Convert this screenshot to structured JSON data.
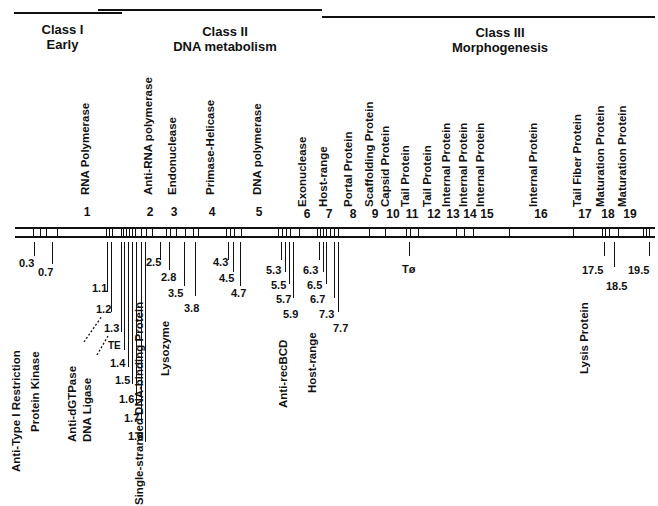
{
  "diagram": {
    "classes": [
      {
        "name": "Class I",
        "subtitle": "Early"
      },
      {
        "name": "Class II",
        "subtitle": "DNA metabolism"
      },
      {
        "name": "Class III",
        "subtitle": "Morphogenesis"
      }
    ],
    "major_genes": [
      {
        "number": "1",
        "label": "RNA Polymerase"
      },
      {
        "number": "2",
        "label": "Anti-RNA polymerase"
      },
      {
        "number": "3",
        "label": "Endonuclease"
      },
      {
        "number": "4",
        "label": "Primase-Helicase"
      },
      {
        "number": "5",
        "label": "DNA polymerase"
      },
      {
        "number": "6",
        "label": "Exonuclease"
      },
      {
        "number": "7",
        "label": "Host-range"
      },
      {
        "number": "8",
        "label": "Portal Protein"
      },
      {
        "number": "9",
        "label": "Scaffolding Protein"
      },
      {
        "number": "10",
        "label": "Capsid Protein"
      },
      {
        "number": "11",
        "label": "Tail Protein"
      },
      {
        "number": "12",
        "label": "Tail Protein"
      },
      {
        "number": "13",
        "label": "Internal Protein"
      },
      {
        "number": "14",
        "label": "Internal Protein"
      },
      {
        "number": "15",
        "label": "Internal Protein"
      },
      {
        "number": "16",
        "label": "Internal Protein"
      },
      {
        "number": "17",
        "label": "Tail Fiber Protein"
      },
      {
        "number": "18",
        "label": "Maturation Protein"
      },
      {
        "number": "19",
        "label": "Maturation Protein"
      }
    ],
    "minor_genes": [
      {
        "number": "0.3",
        "label": "Anti-Type I Restriction"
      },
      {
        "number": "0.7",
        "label": "Protein Kinase"
      },
      {
        "number": "1.1"
      },
      {
        "number": "1.2",
        "label": "Anti-dGTPase"
      },
      {
        "number": "1.3",
        "label": "DNA Ligase"
      },
      {
        "number": "TE"
      },
      {
        "number": "1.4"
      },
      {
        "number": "1.5"
      },
      {
        "number": "1.6"
      },
      {
        "number": "1.7"
      },
      {
        "number": "1.8"
      },
      {
        "number": "2.5",
        "label": "Single-stranded DNA-binding Protein"
      },
      {
        "number": "2.8"
      },
      {
        "number": "3.5",
        "label": "Lysozyme"
      },
      {
        "number": "3.8"
      },
      {
        "number": "4.3"
      },
      {
        "number": "4.5"
      },
      {
        "number": "4.7"
      },
      {
        "number": "5.3"
      },
      {
        "number": "5.5"
      },
      {
        "number": "5.7"
      },
      {
        "number": "5.9",
        "label": "Anti-recBCD"
      },
      {
        "number": "6.3"
      },
      {
        "number": "6.5"
      },
      {
        "number": "6.7"
      },
      {
        "number": "7.3",
        "label": "Host-range"
      },
      {
        "number": "7.7"
      },
      {
        "number": "Tø"
      },
      {
        "number": "17.5",
        "label": "Lysis Protein"
      },
      {
        "number": "18.5"
      },
      {
        "number": "19.5"
      }
    ]
  }
}
